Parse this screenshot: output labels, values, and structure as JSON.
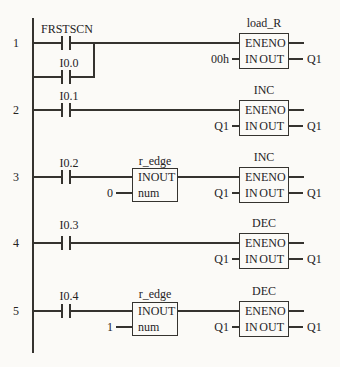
{
  "figure": {
    "type": "plc-ladder-logic-diagram",
    "colors": {
      "background": "#fbfaf7",
      "line": "#35332f",
      "ink": "#25231f"
    }
  },
  "rungs": [
    {
      "number": "1",
      "contacts": [
        {
          "label": "FRSTSCN"
        },
        {
          "label": "I0.0"
        }
      ],
      "block": {
        "title": "load_R",
        "pin_en": "EN",
        "pin_eno": "ENO",
        "pin_in": "IN",
        "pin_out": "OUT",
        "input": "00h",
        "output": "Q1"
      }
    },
    {
      "number": "2",
      "contacts": [
        {
          "label": "I0.1"
        }
      ],
      "block": {
        "title": "INC",
        "pin_en": "EN",
        "pin_eno": "ENO",
        "pin_in": "IN",
        "pin_out": "OUT",
        "input": "Q1",
        "output": "Q1"
      }
    },
    {
      "number": "3",
      "contacts": [
        {
          "label": "I0.2"
        }
      ],
      "edge_block": {
        "title": "r_edge",
        "pin_in": "IN",
        "pin_out": "OUT",
        "pin_num": "num",
        "input": "0"
      },
      "block": {
        "title": "INC",
        "pin_en": "EN",
        "pin_eno": "ENO",
        "pin_in": "IN",
        "pin_out": "OUT",
        "input": "Q1",
        "output": "Q1"
      }
    },
    {
      "number": "4",
      "contacts": [
        {
          "label": "I0.3"
        }
      ],
      "block": {
        "title": "DEC",
        "pin_en": "EN",
        "pin_eno": "ENO",
        "pin_in": "IN",
        "pin_out": "OUT",
        "input": "Q1",
        "output": "Q1"
      }
    },
    {
      "number": "5",
      "contacts": [
        {
          "label": "I0.4"
        }
      ],
      "edge_block": {
        "title": "r_edge",
        "pin_in": "IN",
        "pin_out": "OUT",
        "pin_num": "num",
        "input": "1"
      },
      "block": {
        "title": "DEC",
        "pin_en": "EN",
        "pin_eno": "ENO",
        "pin_in": "IN",
        "pin_out": "OUT",
        "input": "Q1",
        "output": "Q1"
      }
    }
  ]
}
